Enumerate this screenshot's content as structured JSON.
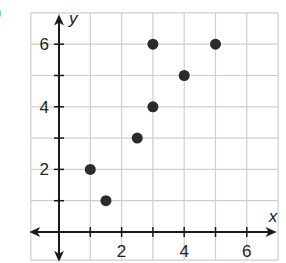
{
  "label_fragment": ")",
  "chart_data": {
    "type": "scatter",
    "title": "",
    "xlabel": "x",
    "ylabel": "y",
    "xlim": [
      -1,
      7
    ],
    "ylim": [
      -1,
      7
    ],
    "grid": true,
    "x_ticks": [
      2,
      4,
      6
    ],
    "y_ticks": [
      2,
      4,
      6
    ],
    "x_tick_labels": [
      "2",
      "4",
      "6"
    ],
    "y_tick_labels": [
      "2",
      "4",
      "6"
    ],
    "series": [
      {
        "name": "points",
        "color": "#2b2b2b",
        "points": [
          [
            1,
            2
          ],
          [
            1.5,
            1
          ],
          [
            2.5,
            3
          ],
          [
            3,
            4
          ],
          [
            3,
            6
          ],
          [
            4,
            5
          ],
          [
            5,
            6
          ]
        ]
      }
    ]
  },
  "colors": {
    "grid": "#cfcfcf",
    "axis": "#1a1a1a",
    "point": "#2b2b2b"
  }
}
